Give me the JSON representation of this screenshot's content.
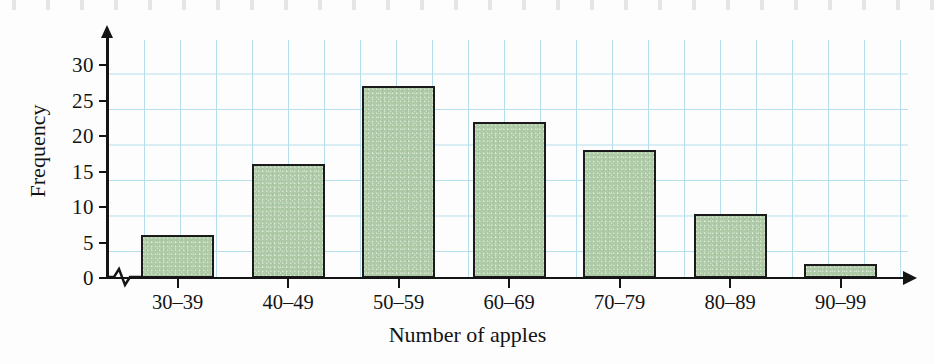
{
  "chart_data": {
    "type": "bar",
    "title": "",
    "subtitle": "",
    "xlabel": "Number of apples",
    "ylabel": "Frequency",
    "categories": [
      "30–39",
      "40–49",
      "50–59",
      "60–69",
      "70–79",
      "80–89",
      "90–99"
    ],
    "values": [
      6,
      16,
      27,
      22,
      18,
      9,
      2
    ],
    "series": [
      {
        "name": "Frequency",
        "values": [
          6,
          16,
          27,
          22,
          18,
          9,
          2
        ]
      }
    ],
    "ylim": [
      0,
      33
    ],
    "ytick_labels": [
      "0",
      "5",
      "10",
      "15",
      "20",
      "25",
      "30"
    ],
    "ytick_values": [
      0,
      5,
      10,
      15,
      20,
      25,
      30
    ],
    "grid": true,
    "legend": false,
    "legend_position": "none",
    "annotations": [
      "axis-break zigzag on x-axis between origin and first bar"
    ],
    "colors": {
      "bar_fill": "#aecaa6",
      "bar_outline": "#1b1b1b",
      "grid": "#a9d9ea",
      "axis": "#141414",
      "text": "#131313",
      "background": "#fdfdfd"
    }
  },
  "axes": {
    "y_title": "Frequency",
    "x_title": "Number of apples",
    "y_ticks": [
      {
        "label": "0",
        "value": 0
      },
      {
        "label": "5",
        "value": 5
      },
      {
        "label": "10",
        "value": 10
      },
      {
        "label": "15",
        "value": 15
      },
      {
        "label": "20",
        "value": 20
      },
      {
        "label": "25",
        "value": 25
      },
      {
        "label": "30",
        "value": 30
      }
    ],
    "x_ticks": [
      {
        "label": "30–39",
        "value": 6
      },
      {
        "label": "40–49",
        "value": 16
      },
      {
        "label": "50–59",
        "value": 27
      },
      {
        "label": "60–69",
        "value": 22
      },
      {
        "label": "70–79",
        "value": 18
      },
      {
        "label": "80–89",
        "value": 9
      },
      {
        "label": "90–99",
        "value": 2
      }
    ]
  }
}
